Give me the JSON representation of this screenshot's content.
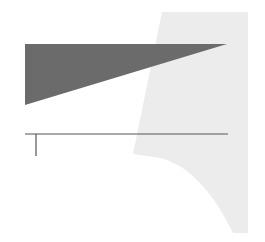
{
  "canvas": {
    "width": 265,
    "height": 242,
    "background": "#ffffff"
  },
  "shapes": {
    "light_panel": {
      "fill": "#ececec",
      "points": "162,12 248,12 248,233 233,233 C 215,195 190,165 160,158 L 133,154 Z"
    },
    "dark_wedge": {
      "fill": "#6b6b6b",
      "points": "25,44 227,44 25,105"
    },
    "baseline": {
      "stroke": "#555555",
      "x1": 25,
      "y1": 134,
      "x2": 228,
      "y2": 134
    },
    "tick": {
      "stroke": "#555555",
      "x1": 36,
      "y1": 134,
      "x2": 36,
      "y2": 156
    }
  }
}
